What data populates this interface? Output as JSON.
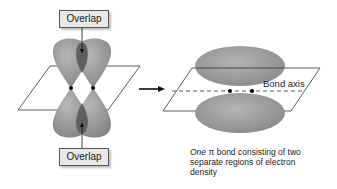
{
  "left_panel": {
    "top_label": "Overlap",
    "bottom_label": "Overlap"
  },
  "right_panel": {
    "bond_axis_label": "Bond axis",
    "caption_italic": "One",
    "caption_symbol": "π",
    "caption_rest": " bond consisting of two separate regions of electron density"
  },
  "colors": {
    "lobe_fill": "#9a9a9a",
    "overlap_fill": "#5f5f5f",
    "plane_stroke": "#333333",
    "label_bg": "#e8e8e8"
  }
}
